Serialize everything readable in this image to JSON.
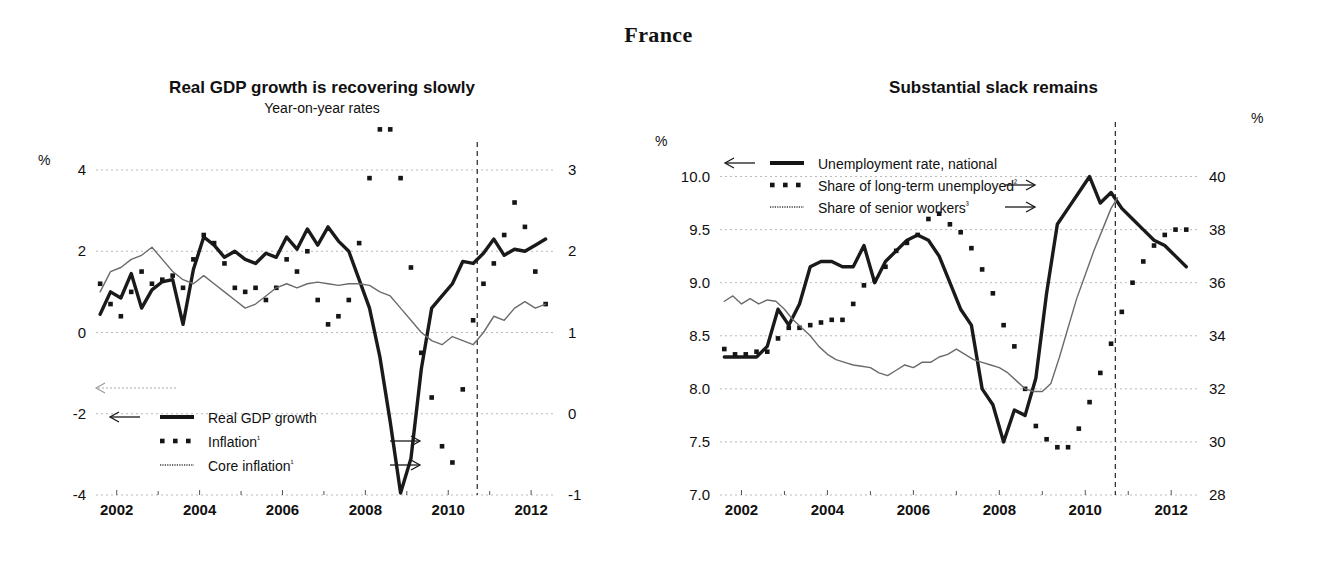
{
  "page": {
    "country_title": "France",
    "background": "#ffffff"
  },
  "left_panel": {
    "title": "Real GDP growth is recovering slowly",
    "subtitle": "Year-on-year rates",
    "unit_left": "%",
    "legend": [
      {
        "label": "Real GDP growth",
        "marker": "solid-thick",
        "axis_arrow": "←"
      },
      {
        "label": "Inflation¹",
        "marker": "dotted",
        "axis_arrow": "→"
      },
      {
        "label": "Core inflation¹",
        "marker": "thin",
        "axis_arrow": "→"
      }
    ]
  },
  "right_panel": {
    "title": "Substantial slack remains",
    "unit_left": "%",
    "unit_right": "%",
    "legend": [
      {
        "label": "Unemployment rate, national",
        "marker": "solid-thick",
        "axis_arrow": "←"
      },
      {
        "label": "Share of long-term unemployed²",
        "marker": "dotted",
        "axis_arrow": "→"
      },
      {
        "label": "Share of senior workers³",
        "marker": "thin",
        "axis_arrow": "→"
      }
    ]
  },
  "chart_data": [
    {
      "id": "real-gdp-growth",
      "type": "line",
      "title": "Real GDP growth is recovering slowly",
      "subtitle": "Year-on-year rates",
      "xlabel": "",
      "ylabel": "%",
      "xlim": [
        2001.5,
        2012.6
      ],
      "xticks": [
        2002,
        2004,
        2006,
        2008,
        2010,
        2012
      ],
      "xtick_labels": [
        "2002",
        "2004",
        "2006",
        "2008",
        "2010",
        "2012"
      ],
      "xminorticks": [
        2003,
        2005,
        2007,
        2009,
        2011
      ],
      "ylim_left": [
        -4,
        4
      ],
      "yticks_left": [
        -4,
        -2,
        0,
        2,
        4
      ],
      "ytick_labels_left": [
        "-4",
        "-2",
        "0",
        "2",
        "4"
      ],
      "ylim_right": [
        -1,
        3
      ],
      "yticks_right": [
        -1,
        0,
        1,
        2,
        3
      ],
      "ytick_labels_right": [
        "-1",
        "0",
        "1",
        "2",
        "3"
      ],
      "grid": true,
      "legend_position": "lower-left",
      "forecast_start": 2010.7,
      "annotations": [
        "vertical dashed line marks start of projection"
      ],
      "series": [
        {
          "name": "Real GDP growth",
          "axis": "left",
          "style": "solid-thick",
          "x": [
            2001.6,
            2001.85,
            2002.1,
            2002.35,
            2002.6,
            2002.85,
            2003.1,
            2003.35,
            2003.6,
            2003.85,
            2004.1,
            2004.35,
            2004.6,
            2004.85,
            2005.1,
            2005.35,
            2005.6,
            2005.85,
            2006.1,
            2006.35,
            2006.6,
            2006.85,
            2007.1,
            2007.35,
            2007.6,
            2007.85,
            2008.1,
            2008.35,
            2008.6,
            2008.85,
            2009.1,
            2009.35,
            2009.6,
            2009.85,
            2010.1,
            2010.35,
            2010.6,
            2010.85,
            2011.1,
            2011.35,
            2011.6,
            2011.85,
            2012.1,
            2012.35
          ],
          "y": [
            0.45,
            1.0,
            0.85,
            1.45,
            0.6,
            1.05,
            1.25,
            1.3,
            0.2,
            1.55,
            2.35,
            2.15,
            1.85,
            2.0,
            1.8,
            1.7,
            1.95,
            1.85,
            2.35,
            2.05,
            2.55,
            2.15,
            2.6,
            2.25,
            2.0,
            1.3,
            0.6,
            -0.6,
            -2.2,
            -3.95,
            -3.1,
            -0.9,
            0.6,
            0.9,
            1.2,
            1.75,
            1.7,
            1.95,
            2.3,
            1.9,
            2.05,
            2.0,
            2.15,
            2.3
          ]
        },
        {
          "name": "Inflation",
          "axis": "right",
          "style": "dotted",
          "x": [
            2001.6,
            2001.85,
            2002.1,
            2002.35,
            2002.6,
            2002.85,
            2003.1,
            2003.35,
            2003.6,
            2003.85,
            2004.1,
            2004.35,
            2004.6,
            2004.85,
            2005.1,
            2005.35,
            2005.6,
            2005.85,
            2006.1,
            2006.35,
            2006.6,
            2006.85,
            2007.1,
            2007.35,
            2007.6,
            2007.85,
            2008.1,
            2008.35,
            2008.6,
            2008.85,
            2009.1,
            2009.35,
            2009.6,
            2009.85,
            2010.1,
            2010.35,
            2010.6,
            2010.85,
            2011.1,
            2011.35,
            2011.6,
            2011.85,
            2012.1,
            2012.35
          ],
          "y": [
            1.6,
            1.35,
            1.2,
            1.5,
            1.75,
            1.6,
            1.65,
            1.7,
            1.55,
            1.9,
            2.2,
            2.1,
            1.85,
            1.55,
            1.5,
            1.55,
            1.4,
            1.55,
            1.9,
            1.75,
            2.0,
            1.4,
            1.1,
            1.2,
            1.4,
            2.1,
            2.9,
            3.5,
            3.5,
            2.9,
            1.8,
            0.75,
            0.2,
            -0.4,
            -0.6,
            0.3,
            1.15,
            1.6,
            1.85,
            2.2,
            2.6,
            2.3,
            1.75,
            1.35,
            1.4
          ]
        },
        {
          "name": "Core inflation",
          "axis": "right",
          "style": "thin",
          "x": [
            2001.6,
            2001.85,
            2002.1,
            2002.35,
            2002.6,
            2002.85,
            2003.1,
            2003.35,
            2003.6,
            2003.85,
            2004.1,
            2004.35,
            2004.6,
            2004.85,
            2005.1,
            2005.35,
            2005.6,
            2005.85,
            2006.1,
            2006.35,
            2006.6,
            2006.85,
            2007.1,
            2007.35,
            2007.6,
            2007.85,
            2008.1,
            2008.35,
            2008.6,
            2008.85,
            2009.1,
            2009.35,
            2009.6,
            2009.85,
            2010.1,
            2010.35,
            2010.6,
            2010.85,
            2011.1,
            2011.35,
            2011.6,
            2011.85,
            2012.1,
            2012.35
          ],
          "y": [
            1.5,
            1.75,
            1.8,
            1.9,
            1.95,
            2.05,
            1.9,
            1.75,
            1.65,
            1.6,
            1.7,
            1.6,
            1.5,
            1.4,
            1.3,
            1.35,
            1.45,
            1.55,
            1.6,
            1.55,
            1.6,
            1.62,
            1.6,
            1.58,
            1.6,
            1.6,
            1.58,
            1.5,
            1.45,
            1.3,
            1.15,
            1.0,
            0.9,
            0.85,
            0.95,
            0.9,
            0.85,
            1.0,
            1.2,
            1.15,
            1.3,
            1.38,
            1.3,
            1.35
          ]
        }
      ]
    },
    {
      "id": "labour-market-slack",
      "type": "line",
      "title": "Substantial slack remains",
      "xlabel": "",
      "ylabel": "%",
      "xlim": [
        2001.5,
        2012.6
      ],
      "xticks": [
        2002,
        2004,
        2006,
        2008,
        2010,
        2012
      ],
      "xtick_labels": [
        "2002",
        "2004",
        "2006",
        "2008",
        "2010",
        "2012"
      ],
      "xminorticks": [
        2003,
        2005,
        2007,
        2009,
        2011
      ],
      "ylim_left": [
        7.0,
        10.25
      ],
      "yticks_left": [
        7.0,
        7.5,
        8.0,
        8.5,
        9.0,
        9.5,
        10.0
      ],
      "ytick_labels_left": [
        "7.0",
        "7.5",
        "8.0",
        "8.5",
        "9.0",
        "9.5",
        "10.0"
      ],
      "ylim_right": [
        28,
        41
      ],
      "yticks_right": [
        28,
        30,
        32,
        34,
        36,
        38,
        40
      ],
      "ytick_labels_right": [
        "28",
        "30",
        "32",
        "34",
        "36",
        "38",
        "40"
      ],
      "grid": true,
      "legend_position": "upper-left",
      "forecast_start": 2010.7,
      "annotations": [
        "vertical dashed line marks start of projection"
      ],
      "series": [
        {
          "name": "Unemployment rate, national",
          "axis": "left",
          "style": "solid-thick",
          "x": [
            2001.6,
            2001.85,
            2002.1,
            2002.35,
            2002.6,
            2002.85,
            2003.1,
            2003.35,
            2003.6,
            2003.85,
            2004.1,
            2004.35,
            2004.6,
            2004.85,
            2005.1,
            2005.35,
            2005.6,
            2005.85,
            2006.1,
            2006.35,
            2006.6,
            2006.85,
            2007.1,
            2007.35,
            2007.6,
            2007.85,
            2008.1,
            2008.35,
            2008.6,
            2008.85,
            2009.1,
            2009.35,
            2009.6,
            2009.85,
            2010.1,
            2010.35,
            2010.6,
            2010.85,
            2011.1,
            2011.35,
            2011.6,
            2011.85,
            2012.1,
            2012.35
          ],
          "y": [
            8.3,
            8.3,
            8.3,
            8.3,
            8.4,
            8.75,
            8.6,
            8.8,
            9.15,
            9.2,
            9.2,
            9.15,
            9.15,
            9.35,
            9.0,
            9.2,
            9.3,
            9.4,
            9.45,
            9.4,
            9.25,
            9.0,
            8.75,
            8.6,
            8.0,
            7.85,
            7.5,
            7.8,
            7.75,
            8.1,
            8.9,
            9.55,
            9.7,
            9.85,
            10.0,
            9.75,
            9.85,
            9.7,
            9.6,
            9.5,
            9.4,
            9.35,
            9.25,
            9.15
          ]
        },
        {
          "name": "Share of long-term unemployed",
          "axis": "right",
          "style": "dotted",
          "x": [
            2001.6,
            2001.85,
            2002.1,
            2002.35,
            2002.6,
            2002.85,
            2003.1,
            2003.35,
            2003.6,
            2003.85,
            2004.1,
            2004.35,
            2004.6,
            2004.85,
            2005.1,
            2005.35,
            2005.6,
            2005.85,
            2006.1,
            2006.35,
            2006.6,
            2006.85,
            2007.1,
            2007.35,
            2007.6,
            2007.85,
            2008.1,
            2008.35,
            2008.6,
            2008.85,
            2009.1,
            2009.35,
            2009.6,
            2009.85,
            2010.1,
            2010.35,
            2010.6,
            2010.85,
            2011.1,
            2011.35,
            2011.6,
            2011.85,
            2012.1,
            2012.35
          ],
          "y": [
            33.5,
            33.3,
            33.3,
            33.4,
            33.4,
            33.9,
            34.3,
            34.3,
            34.4,
            34.5,
            34.6,
            34.6,
            35.2,
            35.9,
            36.1,
            36.6,
            37.2,
            37.5,
            37.8,
            38.4,
            38.6,
            38.2,
            37.9,
            37.3,
            36.5,
            35.6,
            34.4,
            33.6,
            32.0,
            30.6,
            30.1,
            29.8,
            29.8,
            30.5,
            31.5,
            32.6,
            33.7,
            34.9,
            36.0,
            36.8,
            37.4,
            37.8,
            38.0,
            38.0
          ]
        },
        {
          "name": "Share of senior workers",
          "axis": "right",
          "style": "thin",
          "x": [
            2001.6,
            2001.8,
            2002.0,
            2002.2,
            2002.4,
            2002.6,
            2002.8,
            2003.0,
            2003.2,
            2003.4,
            2003.6,
            2003.8,
            2004.0,
            2004.2,
            2004.4,
            2004.6,
            2004.8,
            2005.0,
            2005.2,
            2005.4,
            2005.6,
            2005.8,
            2006.0,
            2006.2,
            2006.4,
            2006.6,
            2006.8,
            2007.0,
            2007.2,
            2007.4,
            2007.6,
            2007.8,
            2008.0,
            2008.2,
            2008.4,
            2008.6,
            2008.8,
            2009.0,
            2009.2,
            2009.4,
            2009.6,
            2009.8,
            2010.0,
            2010.2,
            2010.4,
            2010.6,
            2010.75
          ],
          "y": [
            35.3,
            35.5,
            35.2,
            35.4,
            35.2,
            35.35,
            35.3,
            35.0,
            34.6,
            34.3,
            34.0,
            33.6,
            33.3,
            33.1,
            33.0,
            32.9,
            32.85,
            32.8,
            32.6,
            32.5,
            32.7,
            32.9,
            32.8,
            33.0,
            33.0,
            33.2,
            33.3,
            33.5,
            33.3,
            33.1,
            33.0,
            32.9,
            32.8,
            32.6,
            32.3,
            32.0,
            31.9,
            31.9,
            32.2,
            33.2,
            34.3,
            35.4,
            36.3,
            37.2,
            38.0,
            38.8,
            39.2
          ]
        }
      ]
    }
  ]
}
